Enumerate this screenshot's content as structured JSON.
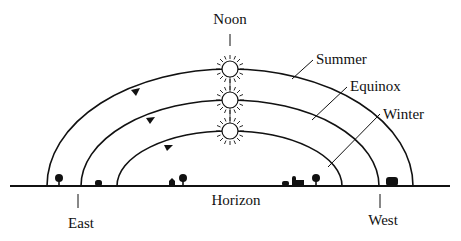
{
  "diagram": {
    "labels": {
      "noon": "Noon",
      "summer": "Summer",
      "equinox": "Equinox",
      "winter": "Winter",
      "horizon": "Horizon",
      "east": "East",
      "west": "West"
    },
    "paths": [
      {
        "name": "Summer",
        "start_x": 47,
        "end_x": 413,
        "peak_y": 69
      },
      {
        "name": "Equinox",
        "start_x": 81,
        "end_x": 379,
        "peak_y": 100
      },
      {
        "name": "Winter",
        "start_x": 117,
        "end_x": 342,
        "peak_y": 131
      }
    ],
    "colors": {
      "line": "#111111",
      "background": "#ffffff"
    }
  }
}
